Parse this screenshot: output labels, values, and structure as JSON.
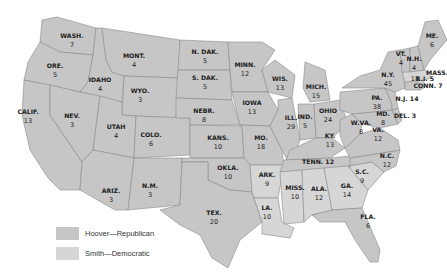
{
  "colors": {
    "hoover": "#c6c6c6",
    "smith": "#d6d6d6",
    "border": "#8a8a8a",
    "text": "#222222"
  },
  "legend": [
    {
      "label": "Hoover—Republican",
      "party": "hoover"
    },
    {
      "label": "Smith—Democratic",
      "party": "smith"
    }
  ],
  "states": [
    {
      "abbr": "WASH.",
      "votes": "7",
      "party": "hoover"
    },
    {
      "abbr": "ORE.",
      "votes": "5",
      "party": "hoover"
    },
    {
      "abbr": "CALIF.",
      "votes": "13",
      "party": "hoover"
    },
    {
      "abbr": "IDAHO",
      "votes": "4",
      "party": "hoover"
    },
    {
      "abbr": "NEV.",
      "votes": "3",
      "party": "hoover"
    },
    {
      "abbr": "MONT.",
      "votes": "4",
      "party": "hoover"
    },
    {
      "abbr": "WYO.",
      "votes": "3",
      "party": "hoover"
    },
    {
      "abbr": "UTAH",
      "votes": "4",
      "party": "hoover"
    },
    {
      "abbr": "COLO.",
      "votes": "6",
      "party": "hoover"
    },
    {
      "abbr": "ARIZ.",
      "votes": "3",
      "party": "hoover"
    },
    {
      "abbr": "N.M.",
      "votes": "3",
      "party": "hoover"
    },
    {
      "abbr": "N. DAK.",
      "votes": "5",
      "party": "hoover"
    },
    {
      "abbr": "S. DAK.",
      "votes": "5",
      "party": "hoover"
    },
    {
      "abbr": "NEBR.",
      "votes": "8",
      "party": "hoover"
    },
    {
      "abbr": "KANS.",
      "votes": "10",
      "party": "hoover"
    },
    {
      "abbr": "OKLA.",
      "votes": "10",
      "party": "hoover"
    },
    {
      "abbr": "TEX.",
      "votes": "20",
      "party": "hoover"
    },
    {
      "abbr": "MINN.",
      "votes": "12",
      "party": "hoover"
    },
    {
      "abbr": "IOWA",
      "votes": "13",
      "party": "hoover"
    },
    {
      "abbr": "MO.",
      "votes": "18",
      "party": "hoover"
    },
    {
      "abbr": "ARK.",
      "votes": "9",
      "party": "smith"
    },
    {
      "abbr": "LA.",
      "votes": "10",
      "party": "smith"
    },
    {
      "abbr": "WIS.",
      "votes": "13",
      "party": "hoover"
    },
    {
      "abbr": "ILL.",
      "votes": "29",
      "party": "hoover"
    },
    {
      "abbr": "MICH.",
      "votes": "15",
      "party": "hoover"
    },
    {
      "abbr": "IND.",
      "votes": "5",
      "party": "hoover"
    },
    {
      "abbr": "OHIO",
      "votes": "24",
      "party": "hoover"
    },
    {
      "abbr": "KY.",
      "votes": "13",
      "party": "hoover"
    },
    {
      "abbr": "TENN.",
      "votes": "12",
      "party": "hoover"
    },
    {
      "abbr": "MISS.",
      "votes": "10",
      "party": "smith"
    },
    {
      "abbr": "ALA.",
      "votes": "12",
      "party": "smith"
    },
    {
      "abbr": "GA.",
      "votes": "14",
      "party": "smith"
    },
    {
      "abbr": "FLA.",
      "votes": "6",
      "party": "hoover"
    },
    {
      "abbr": "S.C.",
      "votes": "9",
      "party": "smith"
    },
    {
      "abbr": "N.C.",
      "votes": "12",
      "party": "hoover"
    },
    {
      "abbr": "VA.",
      "votes": "12",
      "party": "hoover"
    },
    {
      "abbr": "W.VA.",
      "votes": "8",
      "party": "hoover"
    },
    {
      "abbr": "MD.",
      "votes": "8",
      "party": "hoover"
    },
    {
      "abbr": "DEL.",
      "votes": "3",
      "party": "hoover"
    },
    {
      "abbr": "PA.",
      "votes": "38",
      "party": "hoover"
    },
    {
      "abbr": "N.J.",
      "votes": "14",
      "party": "hoover"
    },
    {
      "abbr": "N.Y.",
      "votes": "45",
      "party": "hoover"
    },
    {
      "abbr": "CONN.",
      "votes": "7",
      "party": "hoover"
    },
    {
      "abbr": "R.I.",
      "votes": "5",
      "party": "smith"
    },
    {
      "abbr": "MASS.",
      "votes": "18",
      "party": "smith"
    },
    {
      "abbr": "VT.",
      "votes": "4",
      "party": "hoover"
    },
    {
      "abbr": "N.H.",
      "votes": "4",
      "party": "hoover"
    },
    {
      "abbr": "ME.",
      "votes": "6",
      "party": "hoover"
    }
  ]
}
